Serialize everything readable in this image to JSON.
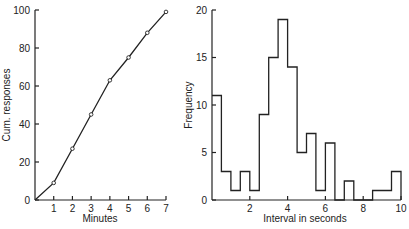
{
  "chart_data": [
    {
      "type": "line",
      "title": "",
      "xlabel": "Minutes",
      "ylabel": "Cum. responses",
      "x": [
        0,
        1,
        2,
        3,
        4,
        5,
        6,
        7
      ],
      "values": [
        0,
        9,
        27,
        45,
        63,
        75,
        88,
        99
      ],
      "markers": "open-circle",
      "xticks": [
        1,
        2,
        3,
        4,
        5,
        6,
        7
      ],
      "yticks": [
        0,
        20,
        40,
        60,
        80,
        100
      ],
      "xlim": [
        0,
        7
      ],
      "ylim": [
        0,
        100
      ],
      "grid": false
    },
    {
      "type": "bar",
      "subtype": "histogram-step",
      "title": "",
      "xlabel": "Interval in seconds",
      "ylabel": "Frequency",
      "bin_width": 0.5,
      "bin_edges": [
        0,
        0.5,
        1,
        1.5,
        2,
        2.5,
        3,
        3.5,
        4,
        4.5,
        5,
        5.5,
        6,
        6.5,
        7,
        7.5,
        8,
        8.5,
        9,
        9.5,
        10
      ],
      "values": [
        11,
        3,
        1,
        3,
        1,
        9,
        15,
        19,
        14,
        5,
        7,
        1,
        6,
        0,
        2,
        0,
        0,
        1,
        1,
        3
      ],
      "xticks": [
        2,
        4,
        6,
        8,
        10
      ],
      "yticks": [
        0,
        5,
        10,
        15,
        20
      ],
      "xlim": [
        0,
        10
      ],
      "ylim": [
        0,
        20
      ],
      "grid": false
    }
  ],
  "left": {
    "xlabel": "Minutes",
    "ylabel": "Cum. responses",
    "xticks": [
      "1",
      "2",
      "3",
      "4",
      "5",
      "6",
      "7"
    ],
    "yticks": [
      "0",
      "20",
      "40",
      "60",
      "80",
      "100"
    ]
  },
  "right": {
    "xlabel": "Interval in seconds",
    "ylabel": "Frequency",
    "xticks": [
      "2",
      "4",
      "6",
      "8",
      "10"
    ],
    "yticks": [
      "0",
      "5",
      "10",
      "15",
      "20"
    ]
  }
}
